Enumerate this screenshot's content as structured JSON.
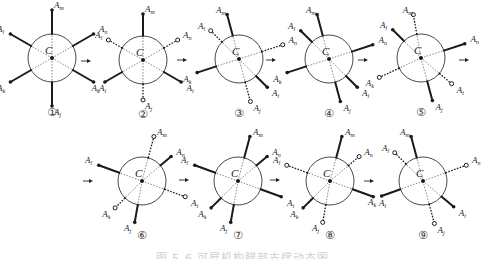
{
  "figure": {
    "caption": "图 5-6  可展机构腿部支撑动态图",
    "center_label": "C",
    "leg_labels": {
      "m": "m",
      "n": "n",
      "i": "i",
      "j": "j",
      "k": "k",
      "l": "l"
    },
    "circle_radius": 24,
    "colors": {
      "line": "#1a1a1a",
      "circle": "#333333",
      "dashed": "#555555"
    },
    "panels": [
      {
        "id": "1",
        "number": "①",
        "cx": 52,
        "cy": 58,
        "legs": [
          {
            "name": "m",
            "angle": 90,
            "len": 48,
            "style": "solid"
          },
          {
            "name": "n",
            "angle": 30,
            "len": 48,
            "style": "solid"
          },
          {
            "name": "i",
            "angle": -30,
            "len": 48,
            "style": "solid"
          },
          {
            "name": "j",
            "angle": -90,
            "len": 48,
            "style": "solid"
          },
          {
            "name": "k",
            "angle": 210,
            "len": 48,
            "style": "solid"
          },
          {
            "name": "l",
            "angle": 150,
            "len": 48,
            "style": "solid"
          }
        ]
      },
      {
        "id": "2",
        "number": "②",
        "cx": 143,
        "cy": 60,
        "legs": [
          {
            "name": "m",
            "angle": 90,
            "len": 46,
            "style": "solid"
          },
          {
            "name": "n",
            "angle": 30,
            "len": 40,
            "style": "dotted"
          },
          {
            "name": "i",
            "angle": -30,
            "len": 44,
            "style": "solid"
          },
          {
            "name": "j",
            "angle": -90,
            "len": 40,
            "style": "dotted"
          },
          {
            "name": "k",
            "angle": 210,
            "len": 44,
            "style": "solid"
          },
          {
            "name": "l",
            "angle": 150,
            "len": 40,
            "style": "dotted"
          }
        ]
      },
      {
        "id": "3",
        "number": "③",
        "cx": 239,
        "cy": 59,
        "legs": [
          {
            "name": "m",
            "angle": 105,
            "len": 46,
            "style": "solid"
          },
          {
            "name": "n",
            "angle": 18,
            "len": 46,
            "style": "dotted"
          },
          {
            "name": "i",
            "angle": -45,
            "len": 40,
            "style": "solid"
          },
          {
            "name": "j",
            "angle": -75,
            "len": 44,
            "style": "dotted"
          },
          {
            "name": "k",
            "angle": 198,
            "len": 44,
            "style": "solid"
          },
          {
            "name": "l",
            "angle": 135,
            "len": 40,
            "style": "dotted"
          }
        ]
      },
      {
        "id": "4",
        "number": "④",
        "cx": 329,
        "cy": 59,
        "legs": [
          {
            "name": "m",
            "angle": 105,
            "len": 46,
            "style": "solid"
          },
          {
            "name": "n",
            "angle": 18,
            "len": 46,
            "style": "solid"
          },
          {
            "name": "i",
            "angle": -45,
            "len": 40,
            "style": "solid"
          },
          {
            "name": "j",
            "angle": -75,
            "len": 44,
            "style": "solid"
          },
          {
            "name": "k",
            "angle": 198,
            "len": 44,
            "style": "solid"
          },
          {
            "name": "l",
            "angle": 135,
            "len": 40,
            "style": "solid"
          }
        ]
      },
      {
        "id": "5",
        "number": "⑤",
        "cx": 421,
        "cy": 58,
        "legs": [
          {
            "name": "m",
            "angle": 100,
            "len": 44,
            "style": "dotted"
          },
          {
            "name": "n",
            "angle": 18,
            "len": 46,
            "style": "solid"
          },
          {
            "name": "i",
            "angle": -40,
            "len": 40,
            "style": "dotted"
          },
          {
            "name": "j",
            "angle": -75,
            "len": 44,
            "style": "solid"
          },
          {
            "name": "k",
            "angle": 205,
            "len": 46,
            "style": "dotted"
          },
          {
            "name": "l",
            "angle": 135,
            "len": 40,
            "style": "solid"
          }
        ]
      },
      {
        "id": "6",
        "number": "⑥",
        "cx": 142,
        "cy": 181,
        "legs": [
          {
            "name": "m",
            "angle": 75,
            "len": 46,
            "style": "dotted"
          },
          {
            "name": "n",
            "angle": 40,
            "len": 38,
            "style": "solid"
          },
          {
            "name": "i",
            "angle": -20,
            "len": 46,
            "style": "dotted"
          },
          {
            "name": "j",
            "angle": -100,
            "len": 42,
            "style": "solid"
          },
          {
            "name": "k",
            "angle": 225,
            "len": 38,
            "style": "dotted"
          },
          {
            "name": "l",
            "angle": 160,
            "len": 46,
            "style": "solid"
          }
        ]
      },
      {
        "id": "7",
        "number": "⑦",
        "cx": 238,
        "cy": 181,
        "legs": [
          {
            "name": "m",
            "angle": 75,
            "len": 46,
            "style": "solid"
          },
          {
            "name": "n",
            "angle": 40,
            "len": 38,
            "style": "solid"
          },
          {
            "name": "i",
            "angle": -20,
            "len": 46,
            "style": "solid"
          },
          {
            "name": "j",
            "angle": -100,
            "len": 42,
            "style": "solid"
          },
          {
            "name": "k",
            "angle": 225,
            "len": 38,
            "style": "solid"
          },
          {
            "name": "l",
            "angle": 160,
            "len": 46,
            "style": "solid"
          }
        ]
      },
      {
        "id": "8",
        "number": "⑧",
        "cx": 330,
        "cy": 181,
        "legs": [
          {
            "name": "m",
            "angle": 75,
            "len": 46,
            "style": "solid"
          },
          {
            "name": "n",
            "angle": 40,
            "len": 38,
            "style": "dotted"
          },
          {
            "name": "i",
            "angle": -20,
            "len": 46,
            "style": "solid"
          },
          {
            "name": "j",
            "angle": -100,
            "len": 42,
            "style": "dotted"
          },
          {
            "name": "k",
            "angle": 225,
            "len": 38,
            "style": "solid"
          },
          {
            "name": "l",
            "angle": 160,
            "len": 46,
            "style": "dotted"
          }
        ]
      },
      {
        "id": "9",
        "number": "⑨",
        "cx": 423,
        "cy": 181,
        "legs": [
          {
            "name": "m",
            "angle": 105,
            "len": 46,
            "style": "solid"
          },
          {
            "name": "n",
            "angle": 20,
            "len": 46,
            "style": "dotted"
          },
          {
            "name": "i",
            "angle": -40,
            "len": 40,
            "style": "solid"
          },
          {
            "name": "j",
            "angle": -75,
            "len": 44,
            "style": "dotted"
          },
          {
            "name": "k",
            "angle": 200,
            "len": 44,
            "style": "solid"
          },
          {
            "name": "l",
            "angle": 135,
            "len": 40,
            "style": "dotted"
          }
        ]
      }
    ],
    "arrows": [
      {
        "x": 86,
        "y": 61
      },
      {
        "x": 182,
        "y": 60
      },
      {
        "x": 271,
        "y": 60
      },
      {
        "x": 363,
        "y": 60
      },
      {
        "x": 464,
        "y": 60
      },
      {
        "x": 88,
        "y": 181
      },
      {
        "x": 184,
        "y": 180
      },
      {
        "x": 275,
        "y": 180
      },
      {
        "x": 369,
        "y": 181
      }
    ]
  }
}
